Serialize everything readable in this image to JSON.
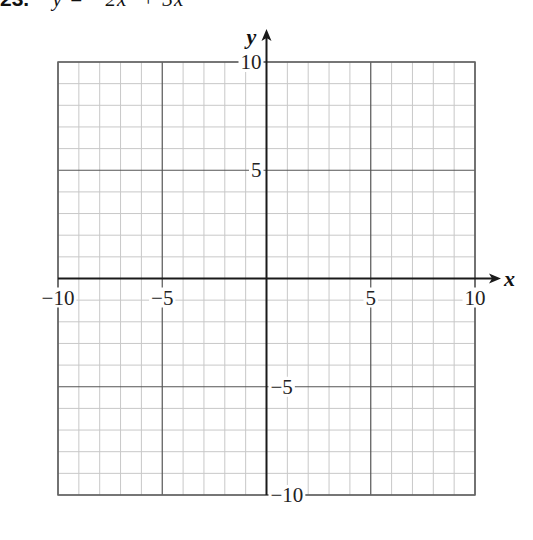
{
  "problem": {
    "number": "23.",
    "equation": "y = −2x² + 3x"
  },
  "chart_data": {
    "type": "line",
    "title": "23. y = −2x² + 3x",
    "xlabel": "x",
    "ylabel": "y",
    "xlim": [
      -10,
      10
    ],
    "ylim": [
      -10,
      10
    ],
    "grid": true,
    "minor_step": 1,
    "major_step": 5,
    "x_ticks": [
      "−10",
      "−5",
      "5",
      "10"
    ],
    "y_ticks": [
      "10",
      "5",
      "−5",
      "−10"
    ],
    "series": [],
    "note": "Blank coordinate grid for graphing; no function plotted"
  },
  "colors": {
    "minor_grid": "#c8c8c8",
    "major_grid": "#555555",
    "axis": "#1a1a1a",
    "border": "#666666"
  }
}
